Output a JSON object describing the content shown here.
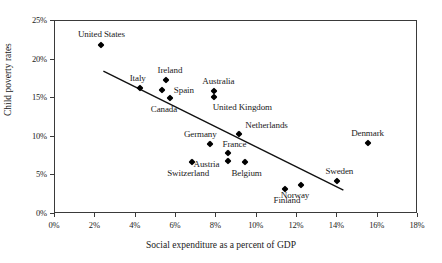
{
  "chart_data": {
    "type": "scatter",
    "title": "",
    "xlabel": "Social expenditure as a percent of GDP",
    "ylabel": "Child poverty rates",
    "xlim": [
      0,
      18
    ],
    "ylim": [
      0,
      25
    ],
    "xticks": [
      "0%",
      "2%",
      "4%",
      "6%",
      "8%",
      "10%",
      "12%",
      "14%",
      "16%",
      "18%"
    ],
    "xtick_values": [
      0,
      2,
      4,
      6,
      8,
      10,
      12,
      14,
      16,
      18
    ],
    "yticks": [
      "0%",
      "5%",
      "10%",
      "15%",
      "20%",
      "25%"
    ],
    "ytick_values": [
      0,
      5,
      10,
      15,
      20,
      25
    ],
    "grid": false,
    "legend": "none",
    "trendline": {
      "x1": 2.4,
      "y1": 18.5,
      "x2": 14.3,
      "y2": 3.1
    },
    "points": [
      {
        "name": "United States",
        "x": 2.3,
        "y": 21.9,
        "label_dx": 0,
        "label_dy": -11
      },
      {
        "name": "Italy",
        "x": 4.2,
        "y": 16.3,
        "label_dx": -2,
        "label_dy": -10
      },
      {
        "name": "Ireland",
        "x": 5.5,
        "y": 17.4,
        "label_dx": 4,
        "label_dy": -10
      },
      {
        "name": "Spain",
        "x": 5.3,
        "y": 16.1,
        "label_dx": 22,
        "label_dy": 0
      },
      {
        "name": "Canada",
        "x": 5.7,
        "y": 15.0,
        "label_dx": -6,
        "label_dy": 11
      },
      {
        "name": "Australia",
        "x": 7.9,
        "y": 15.9,
        "label_dx": 4,
        "label_dy": -10
      },
      {
        "name": "United Kingdom",
        "x": 7.9,
        "y": 15.2,
        "label_dx": 28,
        "label_dy": 10
      },
      {
        "name": "Netherlands",
        "x": 9.1,
        "y": 10.4,
        "label_dx": 28,
        "label_dy": -9
      },
      {
        "name": "Germany",
        "x": 7.7,
        "y": 9.1,
        "label_dx": -10,
        "label_dy": -10
      },
      {
        "name": "France",
        "x": 8.6,
        "y": 7.9,
        "label_dx": 6,
        "label_dy": -9
      },
      {
        "name": "Austria",
        "x": 8.6,
        "y": 6.9,
        "label_dx": -22,
        "label_dy": 3
      },
      {
        "name": "Belgium",
        "x": 9.4,
        "y": 6.7,
        "label_dx": 2,
        "label_dy": 11
      },
      {
        "name": "Switzerland",
        "x": 6.8,
        "y": 6.8,
        "label_dx": -4,
        "label_dy": 11
      },
      {
        "name": "Denmark",
        "x": 15.5,
        "y": 9.2,
        "label_dx": 0,
        "label_dy": -10
      },
      {
        "name": "Sweden",
        "x": 14.0,
        "y": 4.3,
        "label_dx": 2,
        "label_dy": -10
      },
      {
        "name": "Norway",
        "x": 12.2,
        "y": 3.8,
        "label_dx": -6,
        "label_dy": 10
      },
      {
        "name": "Finland",
        "x": 11.4,
        "y": 3.2,
        "label_dx": 2,
        "label_dy": 11
      }
    ]
  }
}
